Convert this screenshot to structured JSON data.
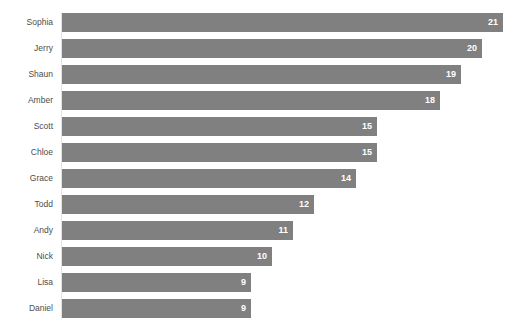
{
  "chart_data": {
    "type": "bar",
    "orientation": "horizontal",
    "title": "",
    "xlabel": "",
    "ylabel": "",
    "categories": [
      "Sophia",
      "Jerry",
      "Shaun",
      "Amber",
      "Scott",
      "Chloe",
      "Grace",
      "Todd",
      "Andy",
      "Nick",
      "Lisa",
      "Daniel"
    ],
    "values": [
      21,
      20,
      19,
      18,
      15,
      15,
      14,
      12,
      11,
      10,
      9,
      9
    ],
    "value_labels": [
      "21",
      "20",
      "19",
      "18",
      "15",
      "15",
      "14",
      "12",
      "11",
      "10",
      "9",
      "9"
    ],
    "xlim": [
      0,
      21
    ],
    "grid": false,
    "legend": false,
    "bar_color": "#808080",
    "value_label_color": "#ffffff",
    "category_label_color": "#4d4d4d",
    "axis_line_color": "#e3e3e6",
    "background": "#ffffff"
  }
}
